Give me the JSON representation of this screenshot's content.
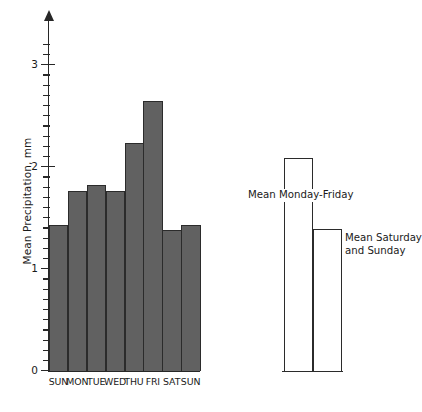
{
  "chart_data": {
    "type": "bar",
    "title": "",
    "xlabel": "",
    "ylabel": "Mean Precipitation, mm",
    "categories": [
      "SUN",
      "MON",
      "TUE",
      "WED",
      "THU",
      "FRI",
      "SAT",
      "SUN"
    ],
    "values": [
      1.43,
      1.76,
      1.82,
      1.76,
      2.24,
      2.65,
      1.38,
      1.43
    ],
    "ylim": [
      0,
      3.2
    ],
    "y_major_ticks": [
      0,
      1,
      2,
      3
    ],
    "y_major_tick_labels": [
      "0",
      "1",
      "2",
      "3"
    ],
    "y_minor_tick_step": 0.1,
    "grid": false,
    "legend_position": "none",
    "bar_fill_color": "#616161",
    "bar_edge_color": "#2b2b2b",
    "axis_color": "#272727",
    "annotations": [
      {
        "label": "Mean Monday-Friday",
        "value": 2.09
      },
      {
        "label": "Mean Saturday and Sunday",
        "value": 1.39
      }
    ],
    "summary_series": {
      "name": "Group means",
      "categories": [
        "Mean Monday-Friday",
        "Mean Saturday and Sunday"
      ],
      "values": [
        2.09,
        1.39
      ],
      "fill_color": "#ffffff",
      "edge_color": "#2b2b2b"
    }
  },
  "axis": {
    "y_title": "Mean Precipitation, mm",
    "ticks": [
      "0",
      "1",
      "2",
      "3"
    ]
  },
  "summary_panel": {
    "label_weekday": "Mean Monday-Friday",
    "label_weekend_line1": "Mean Saturday",
    "label_weekend_line2": "and Sunday"
  }
}
